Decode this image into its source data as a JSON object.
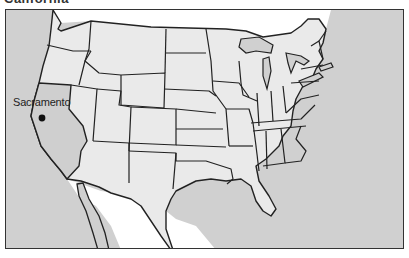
{
  "title": "California",
  "map": {
    "type": "us-state-outline-map",
    "highlighted_state": "California",
    "capital": {
      "label": "Sacramento",
      "marker": "dot"
    },
    "colors": {
      "ocean": "#d0d0d0",
      "land": "#eaeaea",
      "highlighted_state": "#cfcfcf",
      "foreign_land": "#ffffff",
      "border": "#222222",
      "frame": "#333333"
    }
  }
}
